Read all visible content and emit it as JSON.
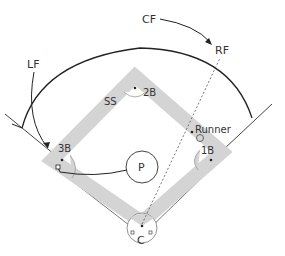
{
  "diagram": {
    "labels": {
      "lf": "LF",
      "cf": "CF",
      "rf": "RF",
      "ss": "SS",
      "second_base": "2B",
      "third_base": "3B",
      "first_base": "1B",
      "pitcher": "P",
      "catcher": "C",
      "runner": "Runner"
    },
    "colors": {
      "infield_band": "#d4d4d4",
      "lines": "#333333",
      "background": "#ffffff"
    }
  }
}
